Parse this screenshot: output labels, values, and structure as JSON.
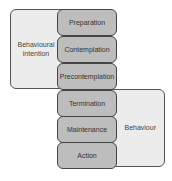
{
  "diagram": {
    "left_group": {
      "label_line1": "Behavioural",
      "label_line2": "intention"
    },
    "right_group": {
      "label": "Behaviour"
    },
    "stages": [
      {
        "label": "Preparation"
      },
      {
        "label": "Contemplation"
      },
      {
        "label": "Precontemplation"
      },
      {
        "label": "Termination"
      },
      {
        "label": "Maintenance"
      },
      {
        "label": "Action"
      }
    ],
    "colors": {
      "stage_fill": "#bdbdbd",
      "group_fill": "#ececec",
      "border": "#444444"
    }
  }
}
